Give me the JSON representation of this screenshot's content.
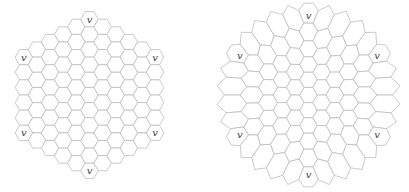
{
  "figure": {
    "stroke_color": "#bdbdbd",
    "label_color": "#444444",
    "background": "#ffffff"
  },
  "panels": [
    {
      "id": "left",
      "name": "regular-hex-board",
      "board_radius": 5,
      "cell_side_px": 8.75,
      "center": [
        89.5,
        95
      ],
      "warp": 0,
      "corner_label": "v",
      "corner_labels": [
        "v",
        "v",
        "v",
        "v",
        "v",
        "v"
      ]
    },
    {
      "id": "right",
      "name": "circular-warped-hex-board",
      "board_radius": 5,
      "cell_side_px": 8.75,
      "center": [
        104.5,
        95
      ],
      "warp": 1,
      "circle_radius_px": 90,
      "corner_label": "v",
      "corner_labels": [
        "v",
        "v",
        "v",
        "v",
        "v",
        "v"
      ]
    }
  ]
}
